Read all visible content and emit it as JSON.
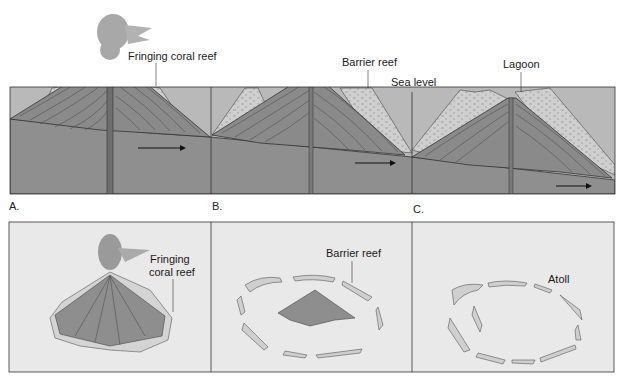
{
  "figure": {
    "top_row": {
      "panels": [
        {
          "id": "A",
          "label": "A.",
          "annotation": "Fringing coral reef"
        },
        {
          "id": "B",
          "label": "B.",
          "annotation": "Barrier reef"
        },
        {
          "id": "C",
          "label": "C.",
          "annotation": "Lagoon"
        }
      ],
      "sea_level_label": "Sea level"
    },
    "bottom_row": {
      "panels": [
        {
          "annotation_line1": "Fringing",
          "annotation_line2": "coral reef"
        },
        {
          "annotation": "Barrier reef"
        },
        {
          "annotation": "Atoll"
        }
      ]
    }
  },
  "colors": {
    "water": "#b9b9b9",
    "seafloor": "#8f8f8f",
    "volcano": "#8a8a8a",
    "reef": "#c8c8c8",
    "bottom_panel_bg": "#e9e9e9",
    "line": "#333333"
  }
}
